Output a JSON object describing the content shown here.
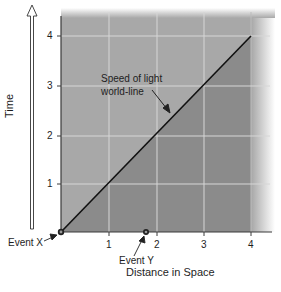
{
  "diagram": {
    "type": "spacetime diagram",
    "x_axis": {
      "label": "Distance in Space",
      "ticks": [
        "1",
        "2",
        "3",
        "4"
      ],
      "range": [
        0,
        4.4
      ]
    },
    "y_axis": {
      "label": "Time",
      "ticks": [
        "1",
        "2",
        "3",
        "4"
      ],
      "range": [
        0,
        4.4
      ]
    },
    "worldline": {
      "label_line1": "Speed of light",
      "label_line2": "world-line",
      "from": [
        0,
        0
      ],
      "to": [
        4,
        4
      ]
    },
    "events": [
      {
        "label": "Event X",
        "x": 0,
        "y": 0
      },
      {
        "label": "Event Y",
        "x": 1.8,
        "y": 0
      }
    ],
    "colors": {
      "light_region": "#a8a8a8",
      "dark_region": "#8b8b8b",
      "gridline": "#d8d8d8",
      "worldline": "#111111",
      "axis": "#333333"
    }
  }
}
